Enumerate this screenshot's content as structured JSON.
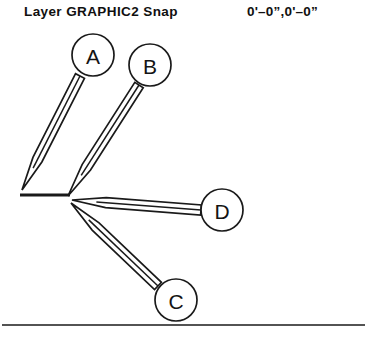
{
  "status_bar": {
    "layer_text": "Layer GRAPHIC2 Snap",
    "coordinates_text": "0'–0”,0'–0”"
  },
  "drawing": {
    "stroke_color": "#1a1a1a",
    "background_color": "#ffffff",
    "convergence_point": {
      "x": 70,
      "y": 198
    },
    "tail_bar": {
      "x1": 20,
      "y1": 195,
      "x2": 70,
      "y2": 195
    },
    "baseline": {
      "x1": 2,
      "y1": 325,
      "x2": 365,
      "y2": 325
    },
    "callouts": [
      {
        "label": "A",
        "circle": {
          "cx": 93,
          "cy": 55,
          "r": 21
        },
        "leader": {
          "tip_x": 22,
          "tip_y": 190,
          "tail_x": 80,
          "tail_y": 76
        }
      },
      {
        "label": "B",
        "circle": {
          "cx": 150,
          "cy": 65,
          "r": 21
        },
        "leader": {
          "tip_x": 68,
          "tip_y": 196,
          "tail_x": 139,
          "tail_y": 85
        }
      },
      {
        "label": "C",
        "circle": {
          "cx": 176,
          "cy": 300,
          "r": 21
        },
        "leader": {
          "tip_x": 71,
          "tip_y": 203,
          "tail_x": 158,
          "tail_y": 286
        }
      },
      {
        "label": "D",
        "circle": {
          "cx": 222,
          "cy": 210,
          "r": 21
        },
        "leader": {
          "tip_x": 72,
          "tip_y": 200,
          "tail_x": 201,
          "tail_y": 210
        }
      }
    ]
  }
}
